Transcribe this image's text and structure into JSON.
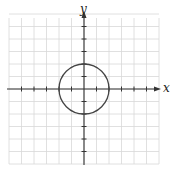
{
  "chart_data": {
    "type": "line",
    "title": "",
    "xlabel": "x",
    "ylabel": "y",
    "xlim": [
      -6,
      6
    ],
    "ylim": [
      -6,
      6
    ],
    "grid": true,
    "grid_step": 1,
    "ticks_x": [
      -5,
      -4,
      -3,
      -2,
      -1,
      1,
      2,
      3,
      4,
      5
    ],
    "ticks_y": [
      -5,
      -4,
      -3,
      -2,
      -1,
      1,
      2,
      3,
      4,
      5
    ],
    "series": [
      {
        "name": "circle",
        "center": [
          0,
          0
        ],
        "radius": 2
      }
    ]
  },
  "colors": {
    "grid": "#d8d8d8",
    "axis": "#333333",
    "curve": "#444444"
  }
}
